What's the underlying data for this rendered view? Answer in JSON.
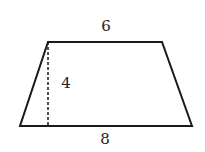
{
  "figure": {
    "shape": "trapezoid",
    "labels": {
      "top_base": "6",
      "height": "4",
      "bottom_base": "8"
    },
    "vertices": {
      "top_left": [
        48,
        42
      ],
      "top_right": [
        162,
        42
      ],
      "bottom_right": [
        192,
        126
      ],
      "bottom_left": [
        20,
        126
      ]
    },
    "height_line": {
      "x": 48,
      "y1": 42,
      "y2": 126,
      "style": "dashed"
    },
    "stroke_color": "#1a1a1a",
    "background": "#ffffff"
  }
}
